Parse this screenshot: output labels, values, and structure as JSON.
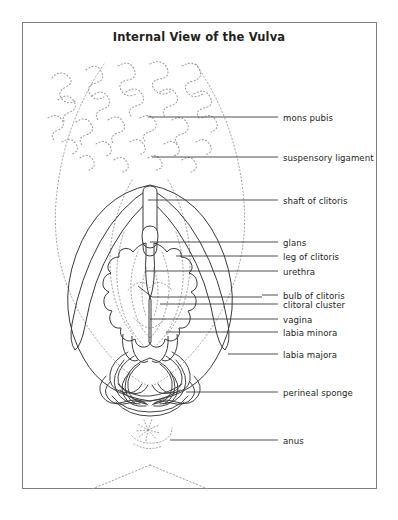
{
  "figure": {
    "title": "Internal View of the Vulva",
    "background_color": "#ffffff",
    "frame_color": "#7d7d7d",
    "ink_color": "#231f20",
    "dotted_color": "#9b9b9b"
  },
  "callouts": [
    {
      "id": "mons-pubis",
      "label": "mons pubis",
      "label_x": 283,
      "label_y": 113,
      "line_x1": 262,
      "line_y1": 117,
      "line_x2": 278,
      "line_y2": 117,
      "leader_x": 148,
      "leader_y": 117
    },
    {
      "id": "suspensory-ligament",
      "label": "suspensory ligament",
      "label_x": 283,
      "label_y": 153,
      "line_x1": 262,
      "line_y1": 157,
      "line_x2": 278,
      "line_y2": 157,
      "leader_x": 152,
      "leader_y": 157
    },
    {
      "id": "shaft-of-clitoris",
      "label": "shaft of clitoris",
      "label_x": 283,
      "label_y": 196,
      "line_x1": 262,
      "line_y1": 200,
      "line_x2": 278,
      "line_y2": 200,
      "leader_x": 148,
      "leader_y": 200
    },
    {
      "id": "glans",
      "label": "glans",
      "label_x": 283,
      "label_y": 238,
      "line_x1": 262,
      "line_y1": 242,
      "line_x2": 278,
      "line_y2": 242,
      "leader_x": 150,
      "leader_y": 242
    },
    {
      "id": "leg-of-clitoris",
      "label": "leg of clitoris",
      "label_x": 283,
      "label_y": 252,
      "line_x1": 262,
      "line_y1": 256,
      "line_x2": 278,
      "line_y2": 256,
      "leader_x": 176,
      "leader_y": 256
    },
    {
      "id": "urethra",
      "label": "urethra",
      "label_x": 283,
      "label_y": 267,
      "line_x1": 262,
      "line_y1": 271,
      "line_x2": 278,
      "line_y2": 271,
      "leader_x": 146,
      "leader_y": 271
    },
    {
      "id": "bulb-of-clitoris",
      "label": "bulb of clitoris",
      "label_x": 283,
      "label_y": 291,
      "line_x1": 262,
      "line_y1": 295,
      "line_x2": 278,
      "line_y2": 295,
      "leader_x": 165,
      "leader_y": 295
    },
    {
      "id": "clitoral-cluster",
      "label": "clitoral cluster",
      "label_x": 283,
      "label_y": 300,
      "line_x1": 262,
      "line_y1": 304,
      "line_x2": 278,
      "line_y2": 304,
      "leader_x": 160,
      "leader_y": 304
    },
    {
      "id": "vagina",
      "label": "vagina",
      "label_x": 283,
      "label_y": 315,
      "line_x1": 262,
      "line_y1": 319,
      "line_x2": 278,
      "line_y2": 319,
      "leader_x": 150,
      "leader_y": 319
    },
    {
      "id": "labia-minora",
      "label": "labia minora",
      "label_x": 283,
      "label_y": 328,
      "line_x1": 262,
      "line_y1": 332,
      "line_x2": 278,
      "line_y2": 332,
      "leader_x": 166,
      "leader_y": 332
    },
    {
      "id": "labia-majora",
      "label": "labia majora",
      "label_x": 283,
      "label_y": 350,
      "line_x1": 262,
      "line_y1": 354,
      "line_x2": 278,
      "line_y2": 354,
      "leader_x": 228,
      "leader_y": 354
    },
    {
      "id": "perineal-sponge",
      "label": "perineal sponge",
      "label_x": 283,
      "label_y": 388,
      "line_x1": 262,
      "line_y1": 392,
      "line_x2": 278,
      "line_y2": 392,
      "leader_x": 186,
      "leader_y": 392
    },
    {
      "id": "anus",
      "label": "anus",
      "label_x": 283,
      "label_y": 436,
      "line_x1": 262,
      "line_y1": 440,
      "line_x2": 278,
      "line_y2": 440,
      "leader_x": 170,
      "leader_y": 440
    }
  ],
  "anatomy": {
    "pubic_hair_label": "pubic-hair-texture",
    "mons_region_label": "mons-pubis-region",
    "clitoris_shaft_label": "clitoris-shaft-shape",
    "clitoris_glans_label": "clitoris-glans-shape",
    "crus_left_label": "left-crus-shape",
    "crus_right_label": "right-crus-shape",
    "bulb_left_label": "left-vestibular-bulb",
    "bulb_right_label": "right-vestibular-bulb",
    "labia_majora_label": "labia-majora-outline",
    "labia_minora_label": "labia-minora-outline",
    "vagina_label": "vaginal-canal-outline",
    "urethra_label": "urethral-opening-outline",
    "perineal_sponge_label": "perineal-sponge-network",
    "anus_label": "anus-starburst",
    "buttock_label": "buttock-crease-lines"
  }
}
